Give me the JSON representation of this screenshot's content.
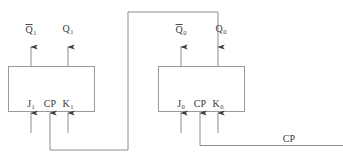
{
  "diagram": {
    "colors": {
      "wire": "#8c8c8c",
      "box_border": "#9a9a9a",
      "text": "#3a3a3a",
      "background": "#ffffff"
    },
    "flipflops": [
      {
        "id": "ff1",
        "name": "flip-flop-1",
        "outputs": {
          "qbar": {
            "base": "Q",
            "subscript": "1",
            "overbar": true
          },
          "q": {
            "base": "Q",
            "subscript": "1",
            "overbar": false
          }
        },
        "inputs": {
          "j": {
            "base": "J",
            "subscript": "1"
          },
          "cp": {
            "base": "CP",
            "subscript": ""
          },
          "k": {
            "base": "K",
            "subscript": "1"
          }
        }
      },
      {
        "id": "ff0",
        "name": "flip-flop-0",
        "outputs": {
          "qbar": {
            "base": "Q",
            "subscript": "0",
            "overbar": true
          },
          "q": {
            "base": "Q",
            "subscript": "0",
            "overbar": false
          }
        },
        "inputs": {
          "j": {
            "base": "J",
            "subscript": "0"
          },
          "cp": {
            "base": "CP",
            "subscript": ""
          },
          "k": {
            "base": "K",
            "subscript": "0"
          }
        }
      }
    ],
    "signals": {
      "clock_label": "CP"
    }
  }
}
